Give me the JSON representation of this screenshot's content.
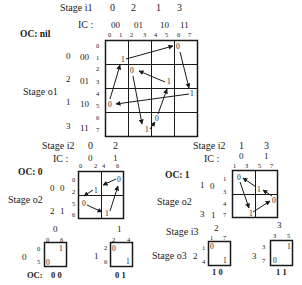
{
  "top": {
    "stage_in_label": "Stage i1",
    "stage_in_values": [
      "0",
      "2",
      "1",
      "3"
    ],
    "ic_label": "IC :",
    "ic_values": [
      "00",
      "01",
      "10",
      "11"
    ],
    "col_indices": [
      "0",
      "1",
      "2",
      "3",
      "4",
      "5",
      "6",
      "7"
    ],
    "oc_label": "OC: nil",
    "stage_out_label": "Stage o1",
    "row_groups": [
      {
        "stage": "0",
        "code": "00",
        "rows": [
          "0",
          "1"
        ]
      },
      {
        "stage": "2",
        "code": "01",
        "rows": [
          "2",
          "3"
        ]
      },
      {
        "stage": "1",
        "code": "10",
        "rows": [
          "4",
          "5"
        ]
      },
      {
        "stage": "3",
        "code": "11",
        "rows": [
          "6",
          "7"
        ]
      }
    ],
    "marks": [
      "1",
      "0",
      "0",
      "1",
      "1",
      "0",
      "0",
      "1"
    ]
  },
  "mid_left": {
    "stage_in_label": "Stage i2",
    "stage_in_values": [
      "0",
      "2"
    ],
    "ic_label": "IC :",
    "ic_values": [
      "0",
      "1"
    ],
    "col_indices": [
      "0",
      "2",
      "4",
      "6"
    ],
    "oc_label": "OC: 0",
    "stage_out_label": "Stage o2",
    "row_groups": [
      {
        "stage": "0",
        "code": "0",
        "rows": [
          "0",
          "2"
        ]
      },
      {
        "stage": "2",
        "code": "1",
        "rows": [
          "5",
          "6"
        ]
      }
    ],
    "marks": [
      "0",
      "1",
      "0",
      "1"
    ]
  },
  "mid_right": {
    "stage_in_label": "Stage i2",
    "stage_in_values": [
      "1",
      "3"
    ],
    "ic_label": "IC :",
    "ic_values": [
      "0",
      "1"
    ],
    "col_indices": [
      "1",
      "3",
      "5",
      "7"
    ],
    "oc_label": "OC: 1",
    "stage_out_label": "Stage o2",
    "row_groups": [
      {
        "stage": "1",
        "code": "0",
        "rows": [
          "1",
          "3"
        ]
      },
      {
        "stage": "3",
        "code": "1",
        "rows": [
          "4",
          "7"
        ]
      }
    ],
    "marks": [
      "0",
      "1",
      "0",
      "1"
    ]
  },
  "bottom": {
    "stage_in_label": "Stage i3",
    "stage_out_label": "Stage o3",
    "oc_label": "OC:",
    "boxes": [
      {
        "top": "0",
        "cols": [
          "0",
          "6"
        ],
        "side": "0",
        "rows": [
          "0",
          "5"
        ],
        "tr": "1",
        "bl": "0",
        "oc": "0 0"
      },
      {
        "top": "1",
        "cols": [
          "2",
          "4"
        ],
        "side": "1",
        "rows": [
          "2",
          "6"
        ],
        "tl": "0",
        "br": "1",
        "oc": "0 1"
      },
      {
        "top": "2",
        "cols": [
          "1",
          "7"
        ],
        "side": "2",
        "rows": [
          "1",
          "4"
        ],
        "tl": "0",
        "br": "1",
        "oc": "1 0"
      },
      {
        "top": "3",
        "cols": [
          "3",
          "5"
        ],
        "side": "3",
        "rows": [
          "3",
          "7"
        ],
        "tr": "1",
        "bl": "0",
        "oc": "1 1"
      }
    ]
  }
}
